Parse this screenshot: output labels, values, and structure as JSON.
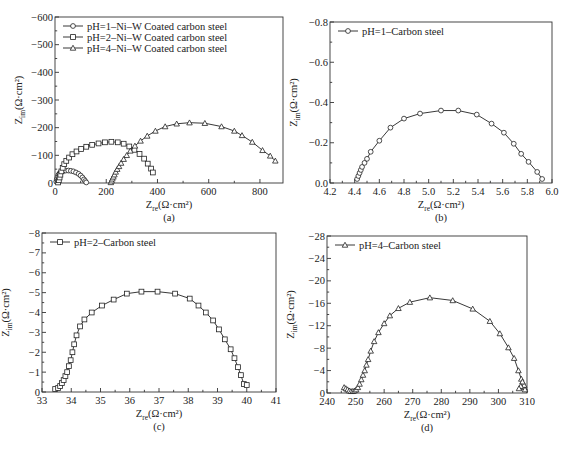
{
  "figure": {
    "panels": [
      "(a)",
      "(b)",
      "(c)",
      "(d)"
    ]
  },
  "chart_data": [
    {
      "id": "a",
      "type": "line",
      "caption": "(a)",
      "title": "",
      "xlabel": "Z_re(Ω·cm²)",
      "ylabel": "Z_im(Ω·cm²)",
      "xlim": [
        0,
        890
      ],
      "ylim": [
        0,
        -600
      ],
      "xticks": [
        0,
        200,
        400,
        600,
        800
      ],
      "yticks": [
        0,
        -100,
        -200,
        -300,
        -400,
        -500,
        -600
      ],
      "grid": false,
      "legend_position": "upper left",
      "frame": {
        "left": 55,
        "right": 283,
        "top": 17,
        "bottom": 183
      },
      "series": [
        {
          "name": "pH=1–Ni–W Coated carbon steel",
          "marker": "circle",
          "x": [
            5,
            7,
            9,
            11,
            14,
            18,
            22,
            28,
            34,
            42,
            52,
            62,
            72,
            82,
            92,
            100,
            107,
            113,
            118,
            122
          ],
          "y": [
            -5,
            -12,
            -18,
            -24,
            -30,
            -35,
            -39,
            -42,
            -44,
            -45,
            -45,
            -44,
            -42,
            -38,
            -33,
            -27,
            -20,
            -13,
            -7,
            -2
          ]
        },
        {
          "name": "pH=2–Ni–W Coated carbon steel",
          "marker": "square",
          "x": [
            12,
            15,
            18,
            21,
            25,
            30,
            36,
            44,
            55,
            68,
            84,
            102,
            122,
            145,
            170,
            195,
            220,
            245,
            268,
            290,
            310,
            330,
            348,
            362,
            375,
            382
          ],
          "y": [
            -2,
            -10,
            -20,
            -30,
            -42,
            -55,
            -68,
            -80,
            -92,
            -104,
            -114,
            -123,
            -131,
            -138,
            -143,
            -147,
            -149,
            -147,
            -142,
            -132,
            -120,
            -105,
            -88,
            -70,
            -52,
            -38
          ]
        },
        {
          "name": "pH=4–Ni–W Coated carbon steel",
          "marker": "triangle",
          "x": [
            218,
            221,
            224,
            228,
            232,
            237,
            243,
            250,
            258,
            268,
            280,
            294,
            312,
            334,
            360,
            392,
            430,
            475,
            525,
            585,
            650,
            700,
            730,
            770,
            810,
            840,
            860
          ],
          "y": [
            -2,
            -8,
            -15,
            -22,
            -30,
            -40,
            -50,
            -60,
            -72,
            -86,
            -100,
            -116,
            -134,
            -152,
            -170,
            -188,
            -204,
            -214,
            -218,
            -216,
            -204,
            -188,
            -172,
            -148,
            -118,
            -98,
            -80
          ]
        }
      ]
    },
    {
      "id": "b",
      "type": "line",
      "caption": "(b)",
      "title": "",
      "xlabel": "Z_re(Ω·cm²)",
      "ylabel": "Z_im(Ω·cm²)",
      "xlim": [
        4.2,
        6.0
      ],
      "ylim": [
        0,
        -0.8
      ],
      "xticks": [
        4.2,
        4.4,
        4.6,
        4.8,
        5.0,
        5.2,
        5.4,
        5.6,
        5.8,
        6.0
      ],
      "xtick_labels": [
        "4.2",
        "4.4",
        "4.6",
        "4.8",
        "5.0",
        "5.2",
        "5.4",
        "5.6",
        "5.8",
        "6.0"
      ],
      "yticks": [
        0,
        -0.2,
        -0.4,
        -0.6,
        -0.8
      ],
      "ytick_labels": [
        "0.0",
        "−0.2",
        "−0.4",
        "−0.6",
        "−0.8"
      ],
      "grid": false,
      "legend_position": "upper left",
      "frame": {
        "left": 330,
        "right": 552,
        "top": 22,
        "bottom": 183
      },
      "series": [
        {
          "name": "pH=1–Carbon steel",
          "marker": "circle",
          "x": [
            4.42,
            4.43,
            4.44,
            4.45,
            4.46,
            4.48,
            4.5,
            4.53,
            4.6,
            4.69,
            4.8,
            4.93,
            5.1,
            5.24,
            5.39,
            5.51,
            5.61,
            5.69,
            5.75,
            5.81,
            5.88,
            5.92
          ],
          "y": [
            -0.02,
            -0.035,
            -0.05,
            -0.065,
            -0.08,
            -0.1,
            -0.12,
            -0.155,
            -0.21,
            -0.275,
            -0.32,
            -0.345,
            -0.36,
            -0.36,
            -0.34,
            -0.295,
            -0.25,
            -0.195,
            -0.145,
            -0.105,
            -0.055,
            -0.02
          ]
        }
      ]
    },
    {
      "id": "c",
      "type": "line",
      "caption": "(c)",
      "title": "",
      "xlabel": "Z_re(Ω·cm²)",
      "ylabel": "Z_im(Ω·cm²)",
      "xlim": [
        33,
        41
      ],
      "ylim": [
        0,
        -8
      ],
      "xticks": [
        33,
        34,
        35,
        36,
        37,
        38,
        39,
        40,
        41
      ],
      "yticks": [
        0,
        -1,
        -2,
        -3,
        -4,
        -5,
        -6,
        -7,
        -8
      ],
      "grid": false,
      "legend_position": "upper left",
      "frame": {
        "left": 42,
        "right": 276,
        "top": 233,
        "bottom": 392
      },
      "series": [
        {
          "name": "pH=2–Carbon steel",
          "marker": "square",
          "x": [
            33.45,
            33.55,
            33.62,
            33.68,
            33.74,
            33.8,
            33.86,
            33.92,
            33.98,
            34.04,
            34.1,
            34.18,
            34.3,
            34.45,
            34.7,
            35.05,
            35.45,
            35.9,
            36.4,
            36.95,
            37.55,
            38.05,
            38.35,
            38.6,
            38.85,
            39.05,
            39.25,
            39.45,
            39.58,
            39.7,
            39.8,
            39.9,
            40.0
          ],
          "y": [
            -0.15,
            -0.2,
            -0.3,
            -0.45,
            -0.6,
            -0.8,
            -1.0,
            -1.3,
            -1.6,
            -2.0,
            -2.4,
            -2.85,
            -3.3,
            -3.65,
            -4.0,
            -4.35,
            -4.65,
            -4.95,
            -5.05,
            -5.05,
            -4.95,
            -4.7,
            -4.35,
            -4.0,
            -3.6,
            -3.15,
            -2.65,
            -2.15,
            -1.7,
            -1.25,
            -0.85,
            -0.4,
            -0.35
          ]
        }
      ]
    },
    {
      "id": "d",
      "type": "line",
      "caption": "(d)",
      "title": "",
      "xlabel": "Z_re(Ω·cm²)",
      "ylabel": "Z_im(Ω·cm²)",
      "xlim": [
        240,
        310
      ],
      "ylim": [
        0,
        -28
      ],
      "xticks": [
        240,
        250,
        260,
        270,
        280,
        290,
        300,
        310
      ],
      "yticks": [
        0,
        -4,
        -8,
        -12,
        -16,
        -20,
        -24,
        -28
      ],
      "grid": false,
      "legend_position": "upper left",
      "frame": {
        "left": 327,
        "right": 527,
        "top": 236,
        "bottom": 393
      },
      "series": [
        {
          "name": "pH=4–Carbon steel",
          "marker": "triangle",
          "x": [
            246.0,
            246.6,
            247.2,
            247.8,
            248.4,
            249.0,
            249.6,
            250.2,
            250.8,
            251.4,
            252.0,
            252.6,
            253.2,
            253.8,
            254.4,
            255.3,
            256.5,
            258.0,
            260.0,
            262.0,
            265.0,
            269.0,
            276.0,
            284.0,
            291.0,
            297.0,
            300.5,
            303.5,
            305.5,
            307.0,
            308.0,
            308.6,
            309.0,
            309.3,
            309.0,
            308.4,
            307.8,
            307.2
          ],
          "y": [
            -1.0,
            -0.8,
            -0.6,
            -0.4,
            -0.3,
            -0.3,
            -0.4,
            -0.6,
            -1.0,
            -1.6,
            -2.4,
            -3.2,
            -4.0,
            -5.0,
            -6.0,
            -7.5,
            -9.2,
            -10.8,
            -12.4,
            -13.8,
            -15.1,
            -16.2,
            -17.0,
            -16.5,
            -15.0,
            -12.8,
            -10.6,
            -8.1,
            -6.2,
            -4.0,
            -2.5,
            -1.6,
            -1.0,
            -0.6,
            -1.4,
            -2.0,
            -1.2,
            -0.8
          ]
        }
      ]
    }
  ]
}
